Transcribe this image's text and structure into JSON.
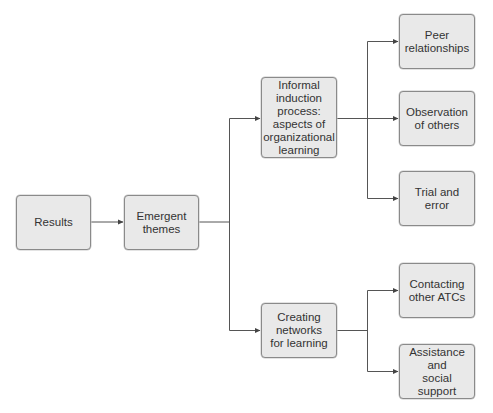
{
  "diagram": {
    "type": "tree-flowchart",
    "colors": {
      "box_fill": "#e9e9e9",
      "box_border": "#8a8a8a",
      "text": "#333333",
      "connector": "#555555"
    },
    "nodes": {
      "results": {
        "label": "Results"
      },
      "emergent_themes": {
        "label": "Emergent\nthemes"
      },
      "informal_induction": {
        "label": "Informal\ninduction\nprocess:\naspects of\norganizational\nlearning"
      },
      "creating_networks": {
        "label": "Creating\nnetworks\nfor learning"
      },
      "peer_relationships": {
        "label": "Peer\nrelationships"
      },
      "observation_of_others": {
        "label": "Observation\nof others"
      },
      "trial_and_error": {
        "label": "Trial and\nerror"
      },
      "contacting_atcs": {
        "label": "Contacting\nother ATCs"
      },
      "assistance_support": {
        "label": "Assistance\nand\nsocial support"
      }
    },
    "edges": [
      {
        "from": "Results",
        "to": "Emergent themes"
      },
      {
        "from": "Emergent themes",
        "to": "Informal induction process: aspects of organizational learning"
      },
      {
        "from": "Emergent themes",
        "to": "Creating networks for learning"
      },
      {
        "from": "Informal induction process: aspects of organizational learning",
        "to": "Peer relationships"
      },
      {
        "from": "Informal induction process: aspects of organizational learning",
        "to": "Observation of others"
      },
      {
        "from": "Informal induction process: aspects of organizational learning",
        "to": "Trial and error"
      },
      {
        "from": "Creating networks for learning",
        "to": "Contacting other ATCs"
      },
      {
        "from": "Creating networks for learning",
        "to": "Assistance and social support"
      }
    ]
  }
}
